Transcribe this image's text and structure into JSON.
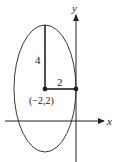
{
  "diagram": {
    "type": "ellipse-on-axes",
    "axes": {
      "x_label": "x",
      "y_label": "y"
    },
    "ellipse": {
      "center_label": "(−2,2)",
      "center": [
        -2,
        2
      ],
      "semi_major_vertical": 4,
      "semi_minor_horizontal": 2
    },
    "segments": {
      "vertical_label": "4",
      "horizontal_label": "2"
    },
    "colors": {
      "stroke": "#222222",
      "background": "#ffffff"
    }
  }
}
